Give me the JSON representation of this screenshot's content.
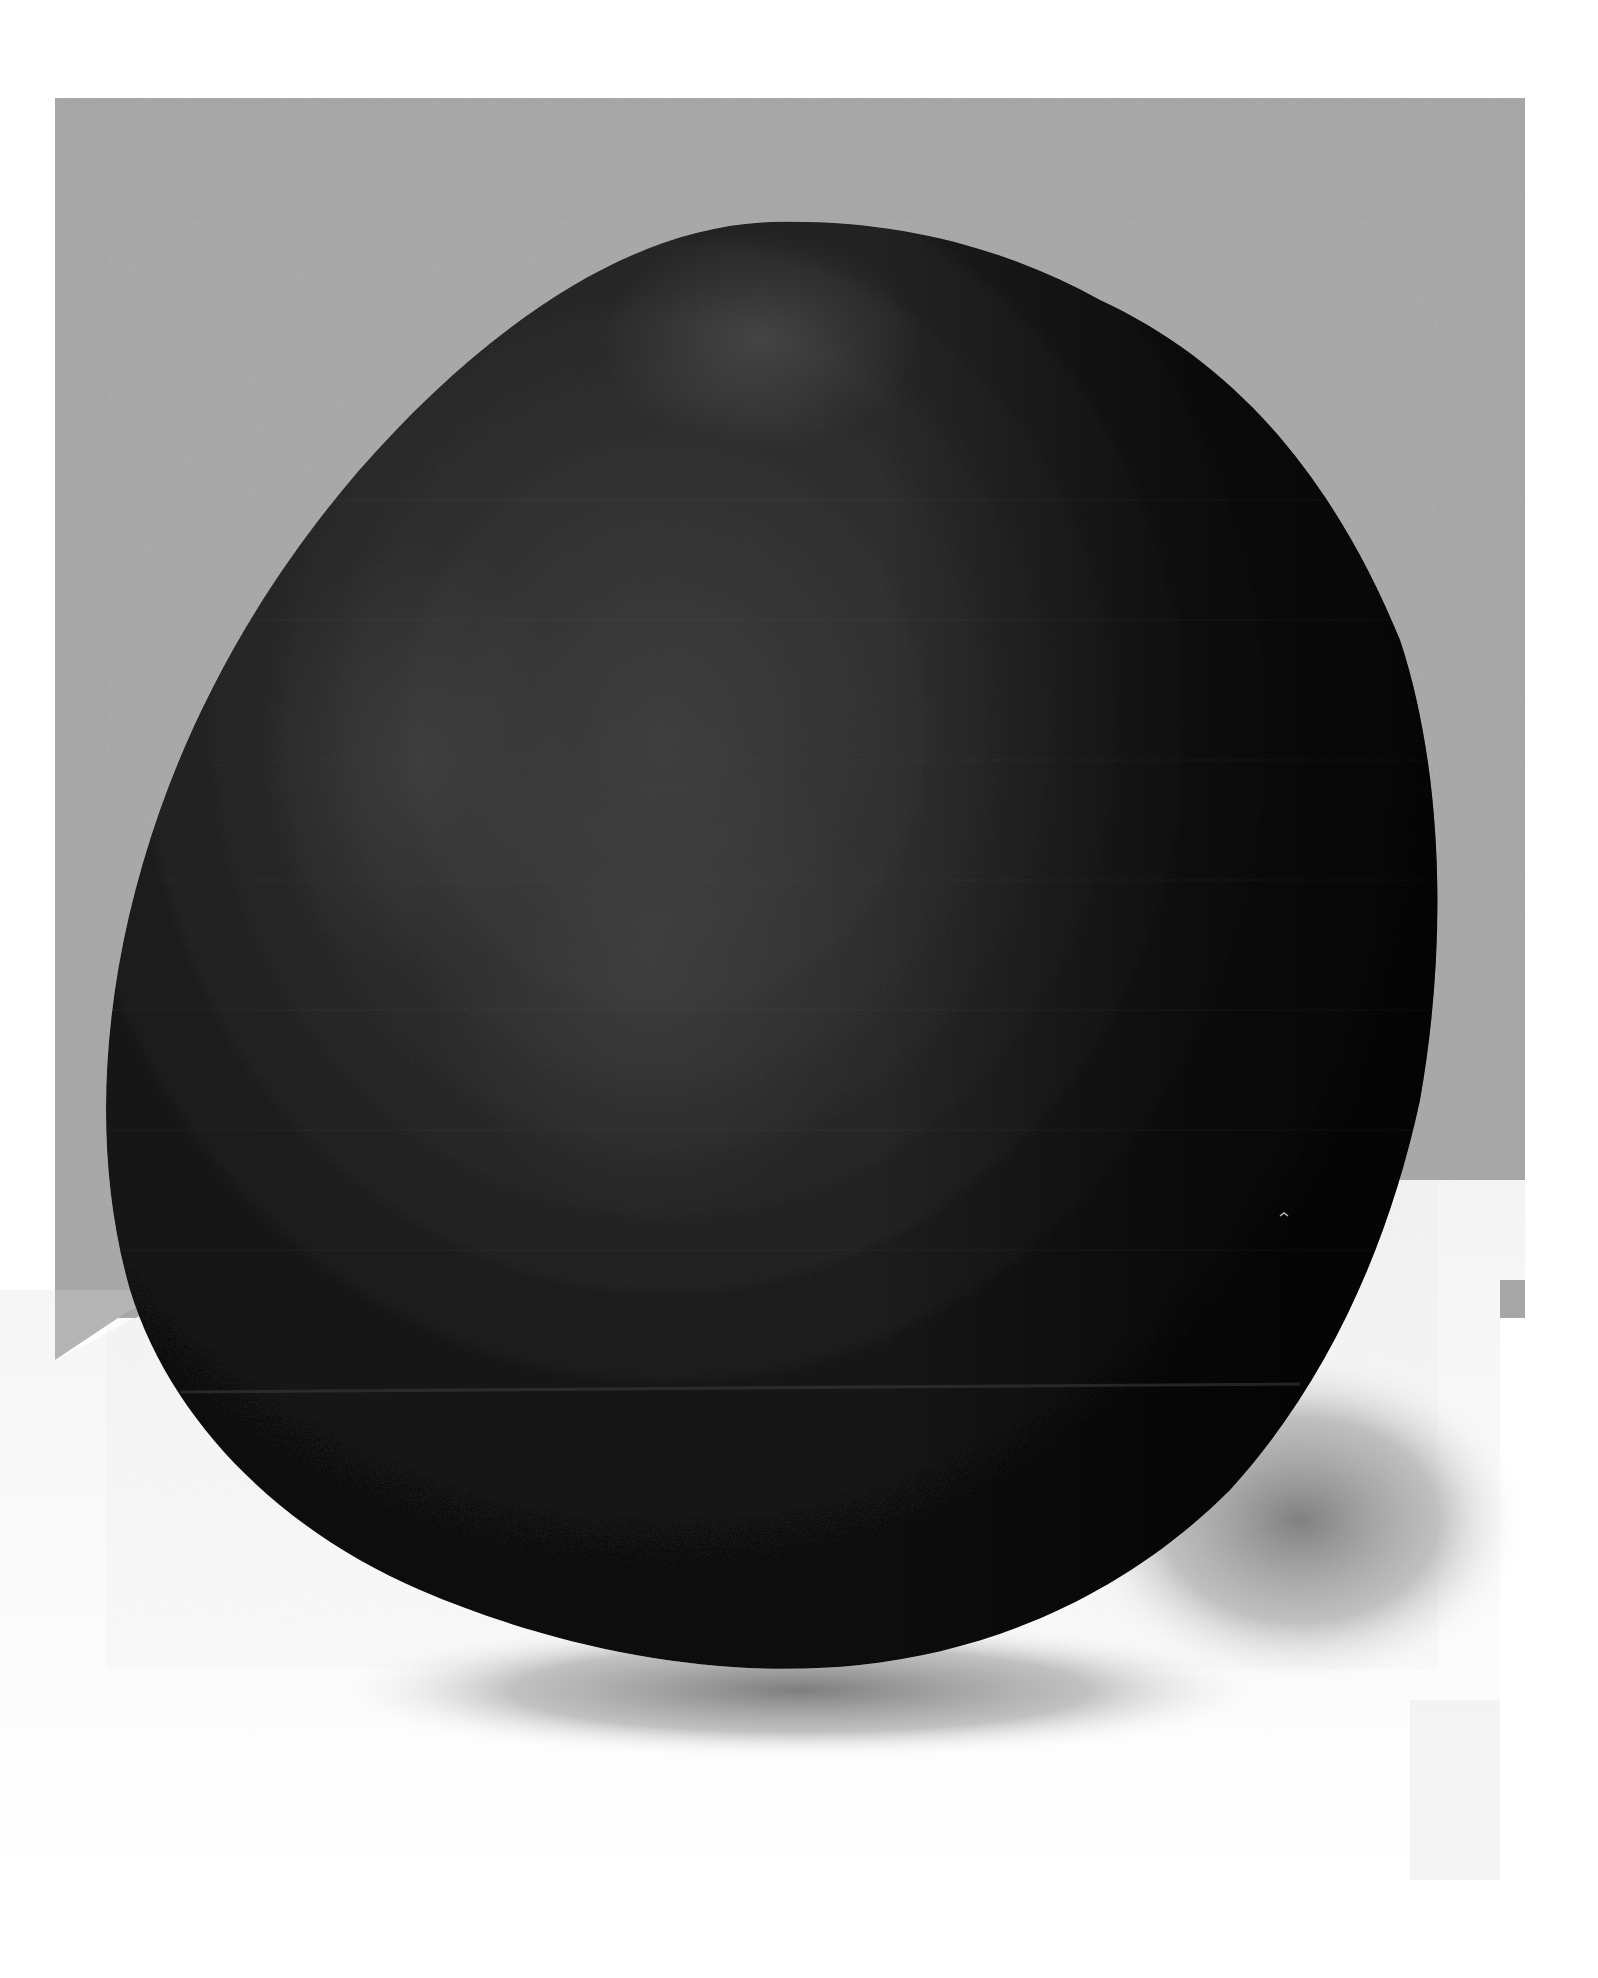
{
  "artwork": {
    "description": "Painting of a large dark rounded pear/egg-shaped form set against a gray wall and a white floor, casting a soft gray shadow",
    "colors": {
      "page_background": "#ffffff",
      "wall": "#a9a9a9",
      "wall_light": "#b4b4b4",
      "floor": "#fafafa",
      "form_dark": "#0c0c0c",
      "form_mid": "#2a2a2a",
      "form_highlight": "#4a4a4a",
      "shadow": "#8a8a8a"
    },
    "regions": {
      "wall_rect": {
        "x": 55,
        "y": 98,
        "width": 1470,
        "height": 1220
      },
      "floor_panel_right_edge_x": 1500,
      "floor_panel_bottom_y": 1880
    }
  }
}
